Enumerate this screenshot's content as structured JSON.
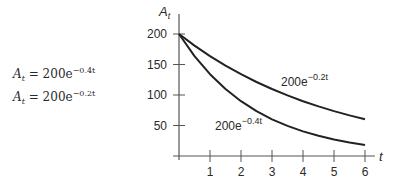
{
  "equations": [
    {
      "lhs": "A",
      "sub": "t",
      "eq": "=",
      "coef": "200e",
      "exp": "−0.4t"
    },
    {
      "lhs": "A",
      "sub": "t",
      "eq": "=",
      "coef": "200e",
      "exp": "−0.2t"
    }
  ],
  "chart_data": {
    "type": "line",
    "title": "",
    "xlabel": "t",
    "ylabel": "A_t",
    "xlim": [
      0,
      6
    ],
    "ylim": [
      0,
      200
    ],
    "x_ticks": [
      1,
      2,
      3,
      4,
      5,
      6
    ],
    "y_ticks": [
      50,
      100,
      150,
      200
    ],
    "grid": false,
    "x": [
      0,
      0.5,
      1,
      1.5,
      2,
      2.5,
      3,
      3.5,
      4,
      4.5,
      5,
      5.5,
      6
    ],
    "series": [
      {
        "name": "200e^{-0.2t}",
        "label_text": "200e",
        "label_exp": "−0.2t",
        "values": [
          200,
          181.0,
          163.7,
          148.2,
          134.1,
          121.3,
          109.8,
          99.3,
          89.9,
          81.3,
          73.6,
          66.6,
          60.2
        ]
      },
      {
        "name": "200e^{-0.4t}",
        "label_text": "200e",
        "label_exp": "−0.4t",
        "values": [
          200,
          163.7,
          134.1,
          109.8,
          89.9,
          73.6,
          60.2,
          49.3,
          40.4,
          33.1,
          27.1,
          22.2,
          18.1
        ]
      }
    ],
    "colors": {
      "line": "#222222",
      "axis": "#555555"
    }
  }
}
